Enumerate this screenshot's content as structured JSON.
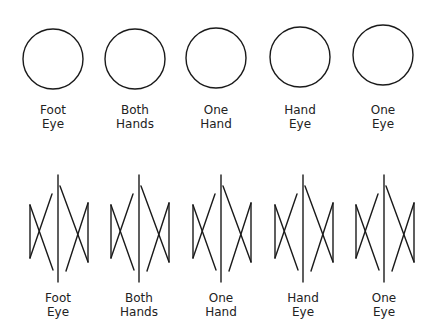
{
  "colors": {
    "stroke": "#1a1a1a",
    "background": "#ffffff",
    "text": "#222222"
  },
  "top_row": {
    "shape": "circle",
    "items": [
      {
        "line1": "Foot",
        "line2": "Eye",
        "cx": 53,
        "cy": 59,
        "r": 30
      },
      {
        "line1": "Both",
        "line2": "Hands",
        "cx": 135,
        "cy": 59,
        "r": 30
      },
      {
        "line1": "One",
        "line2": "Hand",
        "cx": 216,
        "cy": 58,
        "r": 30
      },
      {
        "line1": "Hand",
        "line2": "Eye",
        "cx": 300,
        "cy": 57,
        "r": 30
      },
      {
        "line1": "One",
        "line2": "Eye",
        "cx": 383,
        "cy": 55,
        "r": 30
      }
    ]
  },
  "bottom_row": {
    "shape": "bowtie-pair-with-divider",
    "items": [
      {
        "line1": "Foot",
        "line2": "Eye",
        "x": 58
      },
      {
        "line1": "Both",
        "line2": "Hands",
        "x": 139
      },
      {
        "line1": "One",
        "line2": "Hand",
        "x": 221
      },
      {
        "line1": "Hand",
        "line2": "Eye",
        "x": 303
      },
      {
        "line1": "One",
        "line2": "Eye",
        "x": 384
      }
    ]
  }
}
